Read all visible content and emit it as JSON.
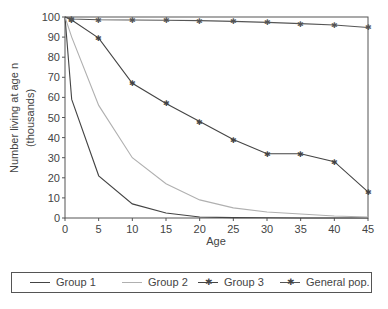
{
  "chart_data": {
    "type": "line",
    "title": "",
    "xlabel": "Age",
    "ylabel": "Number living at age n (thousands)",
    "ylabel_lines": [
      "Number living at age n",
      "(thousands)"
    ],
    "x": [
      0,
      1,
      5,
      10,
      15,
      20,
      25,
      30,
      35,
      40,
      45
    ],
    "xticks": [
      0,
      5,
      10,
      15,
      20,
      25,
      30,
      35,
      40,
      45
    ],
    "yticks": [
      0,
      10,
      20,
      30,
      40,
      50,
      60,
      70,
      80,
      90,
      100
    ],
    "xlim": [
      0,
      45
    ],
    "ylim": [
      0,
      100
    ],
    "grid": false,
    "legend_position": "bottom",
    "series": [
      {
        "name": "Group 1",
        "color": "#444444",
        "marker": "none",
        "values": [
          100,
          59,
          21,
          7,
          2.5,
          0.5,
          0.2,
          0.1,
          0,
          0,
          0
        ]
      },
      {
        "name": "Group 2",
        "color": "#b0b0b0",
        "marker": "none",
        "values": [
          100,
          90,
          56,
          30,
          17,
          9,
          5,
          3,
          2,
          1,
          0.5
        ]
      },
      {
        "name": "Group 3",
        "color": "#444444",
        "marker": "star",
        "values": [
          100,
          98.5,
          89.5,
          67,
          57,
          48,
          39,
          32,
          32,
          28,
          13
        ]
      },
      {
        "name": "General pop.",
        "color": "#555555",
        "marker": "star",
        "values": [
          100,
          99,
          98.6,
          98.5,
          98.4,
          98.2,
          97.8,
          97.3,
          96.7,
          96,
          94.8
        ]
      }
    ]
  },
  "legend": {
    "items": [
      "Group 1",
      "Group 2",
      "Group 3",
      "General pop."
    ]
  }
}
